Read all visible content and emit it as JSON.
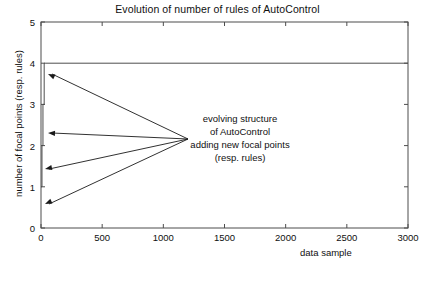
{
  "chart_data": {
    "type": "line",
    "title": "Evolution of number of rules of AutoControl",
    "xlabel": "data sample",
    "ylabel": "number of focal points (resp. rules)",
    "xlim": [
      0,
      3000
    ],
    "ylim": [
      0,
      5
    ],
    "xticks": [
      0,
      500,
      1000,
      1500,
      2000,
      2500,
      3000
    ],
    "xtick_labels": [
      "0",
      "500",
      "1000",
      "1500",
      "2000",
      "2500",
      "3000"
    ],
    "yticks": [
      0,
      1,
      2,
      3,
      4,
      5
    ],
    "ytick_labels": [
      "0",
      "1",
      "2",
      "3",
      "4",
      "5"
    ],
    "grid": false,
    "legend": false,
    "series": [
      {
        "name": "number of focal points (resp. rules)",
        "color": "#4d4d4d",
        "step": true,
        "x": [
          0,
          8,
          8,
          16,
          16,
          26,
          26,
          40,
          40,
          3000
        ],
        "y": [
          1,
          1,
          2,
          2,
          3,
          3,
          4,
          4,
          4,
          4
        ]
      }
    ],
    "annotations": [
      {
        "name": "evolving-structure-note",
        "lines": [
          "evolving structure",
          "of AutoControl",
          "adding new focal points",
          "(resp. rules)"
        ],
        "text_anchor_x": 240,
        "text_top_y": 113,
        "leader_origin": [
          188,
          139
        ],
        "arrow_targets": [
          [
            48,
            74
          ],
          [
            48,
            133
          ],
          [
            45,
            169
          ],
          [
            45,
            204
          ]
        ]
      }
    ]
  },
  "axes": {
    "frame_color": "#4d4d4d",
    "text_color": "#101010",
    "background": "#ffffff"
  }
}
